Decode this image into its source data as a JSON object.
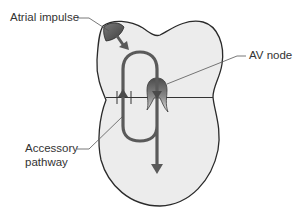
{
  "labels": {
    "atrial_impulse": "Atrial impulse",
    "av_node": "AV node",
    "accessory_pathway_line1": "Accessory",
    "accessory_pathway_line2": "pathway"
  },
  "colors": {
    "heart_fill": "#ececec",
    "outline": "#2a2a2a",
    "pathway": "#5a5a5a",
    "leader_line": "#555555",
    "impulse_blob": "#595959",
    "label_text": "#333333"
  }
}
